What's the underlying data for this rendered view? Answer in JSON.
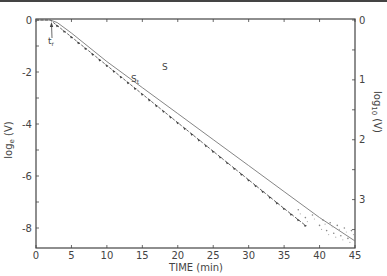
{
  "chart_data": {
    "type": "line",
    "title": "",
    "xlabel": "TIME (min)",
    "ylabel_left": "log_e (V)",
    "ylabel_right": "log_10 (V)",
    "xlim": [
      0,
      45
    ],
    "ylim_left": [
      -8.6,
      0.2
    ],
    "ylim_right": [
      -3.7,
      0.1
    ],
    "x_ticks": [
      0,
      5,
      10,
      15,
      20,
      25,
      30,
      35,
      40,
      45
    ],
    "y_ticks_left": [
      0,
      -2,
      -4,
      -6,
      -8
    ],
    "y_tick_labels_left": [
      "0",
      "-2",
      "-4",
      "-6",
      "-8"
    ],
    "y_ticks_right": [
      0,
      -1,
      -2,
      -3
    ],
    "y_tick_labels_right": [
      "0",
      "1",
      "2",
      "3"
    ],
    "grid": false,
    "legend": "none",
    "annotations": [
      {
        "text": "t_r",
        "x": 2,
        "y": -0.8,
        "note": "arrow pointing to onset of decline"
      },
      {
        "text": "S_t",
        "x": 16,
        "y": -2.3
      },
      {
        "text": "S",
        "x": 22,
        "y": -2.7
      }
    ],
    "series": [
      {
        "name": "S",
        "style": "thin solid line",
        "x": [
          0,
          2,
          3,
          5,
          10,
          15,
          20,
          25,
          30,
          35,
          40,
          45
        ],
        "y": [
          0,
          0,
          -0.1,
          -0.5,
          -1.6,
          -2.6,
          -3.6,
          -4.6,
          -5.6,
          -6.6,
          -7.6,
          -8.5
        ]
      },
      {
        "name": "S_t",
        "style": "solid line with arrowhead markers",
        "x": [
          0,
          2,
          5,
          10,
          15,
          20,
          25,
          30,
          35,
          38
        ],
        "y": [
          0,
          0,
          -0.65,
          -1.75,
          -2.85,
          -3.95,
          -5.05,
          -6.15,
          -7.25,
          -7.9
        ]
      },
      {
        "name": "scatter-tail",
        "style": "dotted points",
        "x": [
          37,
          38,
          39,
          40,
          40.5,
          41,
          41.5,
          42,
          42.5,
          43,
          43.5,
          44,
          44.5
        ],
        "y": [
          -7.3,
          -7.6,
          -7.5,
          -7.9,
          -7.7,
          -8.1,
          -7.8,
          -8.2,
          -7.9,
          -8.3,
          -8.0,
          -8.4,
          -8.1
        ]
      }
    ]
  },
  "labels": {
    "xlabel": "TIME   (min)",
    "ylabel_left": "log",
    "ylabel_left_sub": "e",
    "ylabel_left_tail": " (V)",
    "ylabel_right": "log",
    "ylabel_right_sub": "10",
    "ylabel_right_tail": " (V)",
    "tr": "t",
    "tr_sub": "r",
    "st": "S",
    "st_sub": "t",
    "s": "S"
  }
}
